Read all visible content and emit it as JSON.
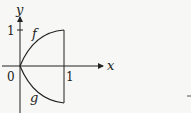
{
  "diagram": {
    "axes": {
      "x_label": "x",
      "y_label": "y",
      "origin_label": "0",
      "x_tick_label": "1",
      "y_tick_label": "1"
    },
    "curves": [
      {
        "name": "f",
        "label": "f",
        "description": "increasing concave curve from (0,0) to (1,1)"
      },
      {
        "name": "g",
        "label": "g",
        "description": "decreasing convex curve from (0,0) to (1,-1)"
      }
    ],
    "vertical_segment": {
      "x": 1,
      "y_from": -1,
      "y_to": 1
    },
    "colors": {
      "stroke": "#222222",
      "background": "#f7f7f5"
    }
  }
}
